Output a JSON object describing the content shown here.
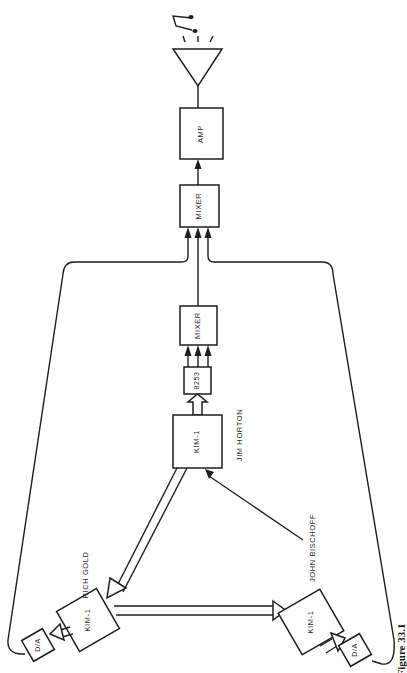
{
  "diagram": {
    "caption": "Figure 33.1",
    "nodes": {
      "speaker": {
        "label": "",
        "icon": "speaker-icon"
      },
      "music_note": {
        "label": "",
        "icon": "music-note-icon"
      },
      "amp": {
        "label": "AMP"
      },
      "mixer_main": {
        "label": "MIXER"
      },
      "mixer_horton": {
        "label": "MIXER"
      },
      "chip_8253": {
        "label": "8253"
      },
      "kim_horton": {
        "label": "KIM-1",
        "operator": "JIM HORTON"
      },
      "kim_gold": {
        "label": "KIM-1",
        "operator": "RICH GOLD"
      },
      "kim_bischoff": {
        "label": "KIM-1",
        "operator": "JOHN BISCHOFF"
      },
      "da_gold": {
        "label": "D/A"
      },
      "da_bischoff": {
        "label": "D/A"
      }
    },
    "edges": [
      {
        "from": "amp",
        "to": "speaker"
      },
      {
        "from": "mixer_main",
        "to": "amp"
      },
      {
        "from": "mixer_horton",
        "to": "mixer_main"
      },
      {
        "from": "da_gold",
        "to": "mixer_main"
      },
      {
        "from": "da_bischoff",
        "to": "mixer_main"
      },
      {
        "from": "chip_8253",
        "to": "mixer_horton",
        "count": 3
      },
      {
        "from": "kim_horton",
        "to": "chip_8253",
        "type": "bus"
      },
      {
        "from": "kim_horton",
        "to": "kim_gold",
        "type": "bus"
      },
      {
        "from": "kim_gold",
        "to": "kim_bischoff",
        "type": "bus"
      },
      {
        "from": "kim_bischoff",
        "to": "kim_horton"
      },
      {
        "from": "kim_gold",
        "to": "da_gold",
        "type": "bus"
      },
      {
        "from": "kim_bischoff",
        "to": "da_bischoff",
        "type": "bus"
      }
    ]
  }
}
